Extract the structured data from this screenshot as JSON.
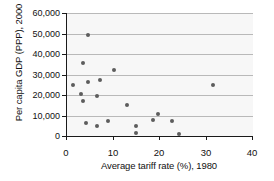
{
  "chart_data": {
    "type": "scatter",
    "title": "",
    "xlabel": "Average tariff rate (%), 1980",
    "ylabel": "Per capita GDP (PPP), 2000",
    "xlim": [
      0,
      40
    ],
    "ylim": [
      0,
      60000
    ],
    "xticks": [
      0,
      10,
      20,
      30,
      40
    ],
    "xtick_labels": [
      "0",
      "10",
      "20",
      "30",
      "40"
    ],
    "yticks": [
      0,
      10000,
      20000,
      30000,
      40000,
      50000,
      60000
    ],
    "ytick_labels": [
      "0",
      "10,000",
      "20,000",
      "30,000",
      "40,000",
      "50,000",
      "60,000"
    ],
    "grid": "horizontal",
    "legend": "none",
    "marker_color": "#5d5d5d",
    "plot_background": "#f7f7f7",
    "gridline_color": "#b9b9b9",
    "axis_color": "#1a1a1a",
    "points": [
      {
        "x": 1.2,
        "y": 25000
      },
      {
        "x": 3.0,
        "y": 20500
      },
      {
        "x": 3.5,
        "y": 35500
      },
      {
        "x": 3.5,
        "y": 17000
      },
      {
        "x": 4.0,
        "y": 6500
      },
      {
        "x": 4.5,
        "y": 49500
      },
      {
        "x": 4.5,
        "y": 26500
      },
      {
        "x": 6.5,
        "y": 19500
      },
      {
        "x": 6.5,
        "y": 5000
      },
      {
        "x": 7.0,
        "y": 27500
      },
      {
        "x": 8.8,
        "y": 7500
      },
      {
        "x": 10.0,
        "y": 32000
      },
      {
        "x": 13.0,
        "y": 15000
      },
      {
        "x": 14.8,
        "y": 5000
      },
      {
        "x": 14.8,
        "y": 1500
      },
      {
        "x": 18.5,
        "y": 8000
      },
      {
        "x": 19.5,
        "y": 10500
      },
      {
        "x": 22.5,
        "y": 7500
      },
      {
        "x": 24.0,
        "y": 1200
      },
      {
        "x": 31.5,
        "y": 25000
      }
    ]
  }
}
